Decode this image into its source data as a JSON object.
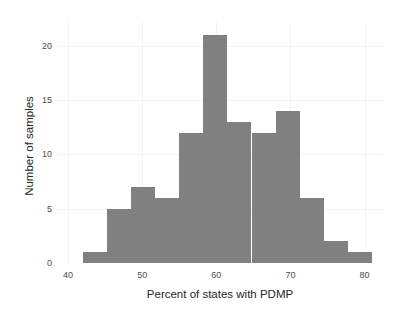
{
  "figure": {
    "clipped_header_text": "",
    "background_color": "#ffffff",
    "bar_color": "#808080",
    "grid_color": "#f4f4f4",
    "tick_text_color": "#4d4d4d",
    "axis_title_color": "#262626"
  },
  "chart_data": {
    "type": "bar",
    "title": "",
    "subtitle": "",
    "xlabel": "Percent of states with PDMP",
    "ylabel": "Number of samples",
    "xlim": [
      38.5,
      82.5
    ],
    "ylim": [
      0,
      22.2
    ],
    "grid": true,
    "legend": null,
    "bin_width": 3.25,
    "categories": [
      "42.0-45.2",
      "45.2-48.5",
      "48.5-51.7",
      "51.7-55.0",
      "55.0-58.2",
      "58.2-61.5",
      "61.5-64.7",
      "64.7-68.0",
      "68.0-71.2",
      "71.2-74.5",
      "74.5-77.7",
      "77.7-81.0"
    ],
    "bin_edges": [
      42.0,
      45.25,
      48.5,
      51.75,
      55.0,
      58.25,
      61.5,
      64.75,
      68.0,
      71.25,
      74.5,
      77.75,
      81.0
    ],
    "values": [
      1,
      5,
      7,
      6,
      12,
      21,
      13,
      12,
      14,
      6,
      2,
      1
    ],
    "xticks": [
      40,
      50,
      60,
      70,
      80
    ],
    "xtick_labels": [
      "40",
      "50",
      "60",
      "70",
      "80"
    ],
    "yticks": [
      0,
      5,
      10,
      15,
      20
    ],
    "ytick_labels": [
      "0",
      "5",
      "10",
      "15",
      "20"
    ]
  }
}
